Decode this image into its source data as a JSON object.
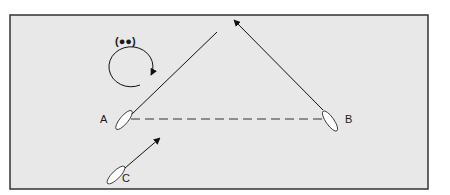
{
  "diagram": {
    "background": "#e8e8e8",
    "border_color": "#333333",
    "labels": {
      "A": "A",
      "B": "B",
      "C": "C",
      "sound_signal": "(●●)"
    },
    "boats": [
      {
        "id": "A",
        "label": "A"
      },
      {
        "id": "B",
        "label": "B"
      },
      {
        "id": "C",
        "label": "C"
      }
    ]
  }
}
